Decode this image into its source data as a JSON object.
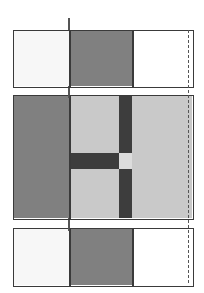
{
  "figure": {
    "canvas": {
      "width": 204,
      "height": 293,
      "background": "#ffffff"
    },
    "border_color": "#3a3a3a",
    "guide_color": "#555555"
  },
  "palette": {
    "offwhite": "#f7f7f7",
    "white": "#ffffff",
    "medium_gray": "#808080",
    "light_gray": "#c9c9c9",
    "pale_gray": "#dcdcdc",
    "dark_gray": "#3d3d3d",
    "border": "#3a3a3a",
    "guide": "#555555"
  },
  "guides": [
    {
      "name": "left-alignment-guide",
      "x": 68,
      "y": 18,
      "height": 265,
      "style": "solid"
    },
    {
      "name": "right-alignment-guide",
      "x": 188,
      "y": 30,
      "height": 253,
      "style": "dashed"
    }
  ],
  "panels": [
    {
      "id": "top-panel",
      "label": "Top panel",
      "x": 13,
      "y": 30,
      "width": 181,
      "height": 58,
      "cells": [
        {
          "name": "top-cell-left",
          "label": "Left cell",
          "x": 0,
          "y": 0,
          "width": 55,
          "height": 55,
          "fill": "#f7f7f7"
        },
        {
          "name": "top-cell-middle",
          "label": "Middle cell",
          "x": 55,
          "y": 0,
          "width": 63,
          "height": 55,
          "fill": "#808080"
        },
        {
          "name": "top-cell-right",
          "label": "Right cell",
          "x": 118,
          "y": 0,
          "width": 60,
          "height": 55,
          "fill": "#ffffff"
        }
      ],
      "dividers": [
        55,
        118
      ]
    },
    {
      "id": "middle-panel",
      "label": "Middle panel",
      "x": 13,
      "y": 95,
      "width": 181,
      "height": 125,
      "cells": [
        {
          "name": "middle-block-left",
          "label": "Left block",
          "x": 0,
          "y": 0,
          "width": 55,
          "height": 122,
          "fill": "#808080"
        },
        {
          "name": "middle-quadrant-topleft",
          "label": "Upper-left quad",
          "x": 55,
          "y": 0,
          "width": 50,
          "height": 57,
          "fill": "#c9c9c9"
        },
        {
          "name": "middle-bar-vertical-top",
          "label": "Upper dark bar",
          "x": 105,
          "y": 0,
          "width": 13,
          "height": 57,
          "fill": "#3d3d3d"
        },
        {
          "name": "middle-bar-horizontal",
          "label": "Horizontal band",
          "x": 55,
          "y": 57,
          "width": 50,
          "height": 16,
          "fill": "#3d3d3d"
        },
        {
          "name": "middle-center-square",
          "label": "Center square",
          "x": 105,
          "y": 57,
          "width": 13,
          "height": 16,
          "fill": "#dcdcdc"
        },
        {
          "name": "middle-quadrant-botleft",
          "label": "Lower-left quad",
          "x": 55,
          "y": 73,
          "width": 50,
          "height": 49,
          "fill": "#c9c9c9"
        },
        {
          "name": "middle-bar-vertical-bot",
          "label": "Lower dark bar",
          "x": 105,
          "y": 73,
          "width": 13,
          "height": 49,
          "fill": "#3d3d3d"
        },
        {
          "name": "middle-block-right",
          "label": "Right block",
          "x": 118,
          "y": 0,
          "width": 60,
          "height": 122,
          "fill": "#c9c9c9"
        }
      ],
      "dividers": [
        55
      ]
    },
    {
      "id": "bottom-panel",
      "label": "Bottom panel",
      "x": 13,
      "y": 228,
      "width": 181,
      "height": 59,
      "cells": [
        {
          "name": "bottom-cell-left",
          "label": "Left cell",
          "x": 0,
          "y": 0,
          "width": 55,
          "height": 56,
          "fill": "#f7f7f7"
        },
        {
          "name": "bottom-cell-middle",
          "label": "Middle cell",
          "x": 55,
          "y": 0,
          "width": 63,
          "height": 56,
          "fill": "#808080"
        },
        {
          "name": "bottom-cell-right",
          "label": "Right cell",
          "x": 118,
          "y": 0,
          "width": 60,
          "height": 56,
          "fill": "#ffffff"
        }
      ],
      "dividers": [
        55,
        118
      ]
    }
  ]
}
